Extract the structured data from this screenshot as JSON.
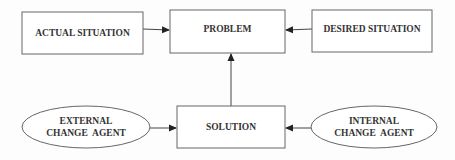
{
  "diagram": {
    "nodes": [
      {
        "id": "actual",
        "shape": "rect",
        "label": "ACTUAL SITUATION"
      },
      {
        "id": "problem",
        "shape": "rect",
        "label": "PROBLEM"
      },
      {
        "id": "desired",
        "shape": "rect",
        "label": "DESIRED SITUATION"
      },
      {
        "id": "solution",
        "shape": "rect",
        "label": "SOLUTION"
      },
      {
        "id": "external",
        "shape": "ellipse",
        "label_line1": "EXTERNAL",
        "label_line2": "CHANGE  AGENT"
      },
      {
        "id": "internal",
        "shape": "ellipse",
        "label_line1": "INTERNAL",
        "label_line2": "CHANGE  AGENT"
      }
    ],
    "edges": [
      {
        "from": "actual",
        "to": "problem"
      },
      {
        "from": "desired",
        "to": "problem"
      },
      {
        "from": "solution",
        "to": "problem"
      },
      {
        "from": "external",
        "to": "solution"
      },
      {
        "from": "internal",
        "to": "solution"
      }
    ],
    "colors": {
      "stroke": "#555555",
      "text": "#333333",
      "background": "#fdfdfd"
    }
  }
}
